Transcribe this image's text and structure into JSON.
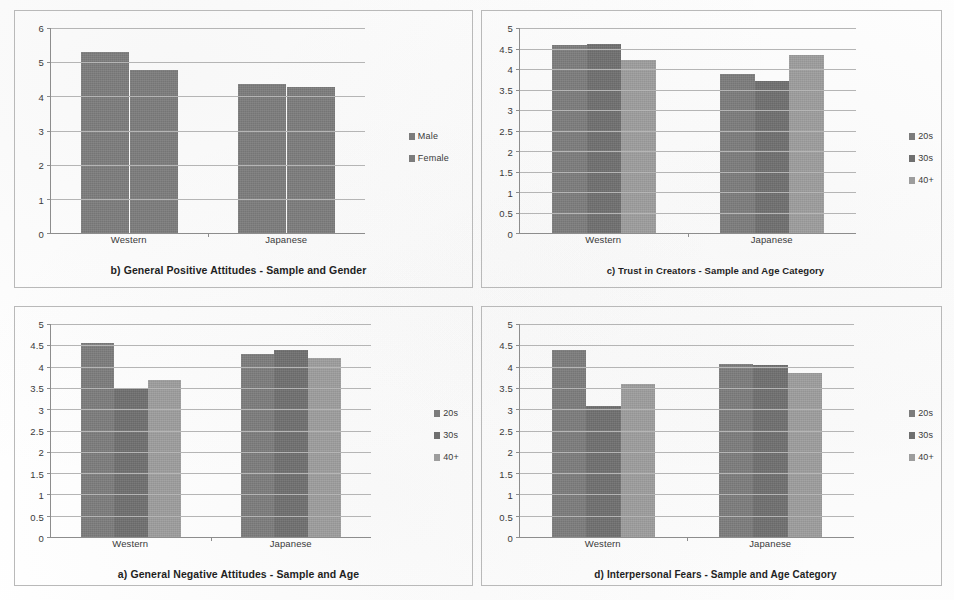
{
  "figure": {
    "panel_count": 4,
    "colors": {
      "series_1": "#7c7c7c",
      "series_2": "#6f6f6f",
      "series_3": "#9d9d9d",
      "axis": "#8d8d8d",
      "gridline": "#b5b5b5",
      "frame": "#b9b9b9",
      "text": "#2b2b2b",
      "background": "#ffffff"
    }
  },
  "chart_data": [
    {
      "id": "panel-b",
      "position": "top-left",
      "type": "bar",
      "title": "b) General Positive Attitudes - Sample and Gender",
      "xlabel": "",
      "ylabel": "",
      "categories": [
        "Western",
        "Japanese"
      ],
      "ylim": [
        0,
        6
      ],
      "ytick_step": 1,
      "ytick_labels": [
        "0",
        "1",
        "2",
        "3",
        "4",
        "5",
        "6"
      ],
      "grid": true,
      "legend_position": "right",
      "series": [
        {
          "name": "Male",
          "values": [
            5.3,
            4.35
          ],
          "color": "#7c7c7c"
        },
        {
          "name": "Female",
          "values": [
            4.78,
            4.28
          ],
          "color": "#7c7c7c"
        }
      ]
    },
    {
      "id": "panel-c",
      "position": "top-right",
      "type": "bar",
      "title": "c) Trust in Creators - Sample and Age Category",
      "xlabel": "",
      "ylabel": "",
      "categories": [
        "Western",
        "Japanese"
      ],
      "ylim": [
        0,
        5
      ],
      "ytick_step": 0.5,
      "ytick_labels": [
        "0",
        "0.5",
        "1",
        "1.5",
        "2",
        "2.5",
        "3",
        "3.5",
        "4",
        "4.5",
        "5"
      ],
      "grid": true,
      "legend_position": "right",
      "series": [
        {
          "name": "20s",
          "values": [
            4.58,
            3.87
          ],
          "color": "#7c7c7c"
        },
        {
          "name": "30s",
          "values": [
            4.6,
            3.7
          ],
          "color": "#6f6f6f"
        },
        {
          "name": "40+",
          "values": [
            4.22,
            4.33
          ],
          "color": "#9d9d9d"
        }
      ]
    },
    {
      "id": "panel-a",
      "position": "bottom-left",
      "type": "bar",
      "title": "a) General Negative Attitudes - Sample and Age",
      "xlabel": "",
      "ylabel": "",
      "categories": [
        "Western",
        "Japanese"
      ],
      "ylim": [
        0,
        5
      ],
      "ytick_step": 0.5,
      "ytick_labels": [
        "0",
        "0.5",
        "1",
        "1.5",
        "2",
        "2.5",
        "3",
        "3.5",
        "4",
        "4.5",
        "5"
      ],
      "grid": true,
      "legend_position": "right",
      "series": [
        {
          "name": "20s",
          "values": [
            4.55,
            4.3
          ],
          "color": "#7c7c7c"
        },
        {
          "name": "30s",
          "values": [
            3.5,
            4.38
          ],
          "color": "#6f6f6f"
        },
        {
          "name": "40+",
          "values": [
            3.68,
            4.2
          ],
          "color": "#9d9d9d"
        }
      ]
    },
    {
      "id": "panel-d",
      "position": "bottom-right",
      "type": "bar",
      "title": "d) Interpersonal Fears - Sample and Age Category",
      "xlabel": "",
      "ylabel": "",
      "categories": [
        "Western",
        "Japanese"
      ],
      "ylim": [
        0,
        5
      ],
      "ytick_step": 0.5,
      "ytick_labels": [
        "0",
        "0.5",
        "1",
        "1.5",
        "2",
        "2.5",
        "3",
        "3.5",
        "4",
        "4.5",
        "5"
      ],
      "grid": true,
      "legend_position": "right",
      "series": [
        {
          "name": "20s",
          "values": [
            4.38,
            4.07
          ],
          "color": "#7c7c7c"
        },
        {
          "name": "30s",
          "values": [
            3.07,
            4.03
          ],
          "color": "#6f6f6f"
        },
        {
          "name": "40+",
          "values": [
            3.6,
            3.85
          ],
          "color": "#9d9d9d"
        }
      ]
    }
  ]
}
